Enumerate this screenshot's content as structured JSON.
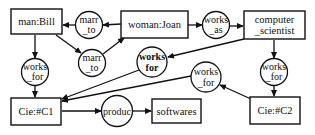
{
  "diagram": {
    "type": "conceptual-graph",
    "concepts": {
      "bill": {
        "label": "man:Bill"
      },
      "joan": {
        "label": "woman:Joan"
      },
      "cs": {
        "line1": "computer",
        "line2": "_scientist"
      },
      "c1": {
        "label": "Cie:#C1"
      },
      "softwares": {
        "label": "softwares"
      },
      "c2": {
        "label": "Cie:#C2"
      }
    },
    "relations": {
      "marr_top": {
        "line1": "marr",
        "line2": "_to"
      },
      "marr_bottom": {
        "line1": "marr",
        "line2": "_to"
      },
      "works_as": {
        "line1": "works",
        "line2": "_as"
      },
      "works_for_bill": {
        "line1": "works",
        "line2": "_for"
      },
      "works_for_cs": {
        "line1": "works",
        "line2": "for"
      },
      "works_for_c2": {
        "line1": "works",
        "line2": "_for"
      },
      "works_for_right": {
        "line1": "works",
        "line2": "_for"
      },
      "produc": {
        "label": "produc"
      }
    },
    "edges": [
      {
        "from": "woman:Joan",
        "to": "marr_to (top)"
      },
      {
        "from": "marr_to (top)",
        "to": "man:Bill"
      },
      {
        "from": "man:Bill",
        "to": "marr_to (bottom)"
      },
      {
        "from": "marr_to (bottom)",
        "to": "woman:Joan"
      },
      {
        "from": "woman:Joan",
        "to": "works_as"
      },
      {
        "from": "works_as",
        "to": "computer_scientist"
      },
      {
        "from": "man:Bill",
        "to": "works_for (left)"
      },
      {
        "from": "works_for (left)",
        "to": "Cie:#C1"
      },
      {
        "from": "computer_scientist",
        "to": "works_for (bold)"
      },
      {
        "from": "works_for (bold)",
        "to": "Cie:#C1"
      },
      {
        "from": "Cie:#C2",
        "to": "works_for (middle-right)"
      },
      {
        "from": "works_for (middle-right)",
        "to": "Cie:#C1"
      },
      {
        "from": "computer_scientist",
        "to": "works_for (right)"
      },
      {
        "from": "works_for (right)",
        "to": "Cie:#C2"
      },
      {
        "from": "Cie:#C1",
        "to": "produc"
      },
      {
        "from": "produc",
        "to": "softwares"
      }
    ],
    "colors": {
      "stroke": "#111111",
      "background": "#ffffff"
    }
  }
}
